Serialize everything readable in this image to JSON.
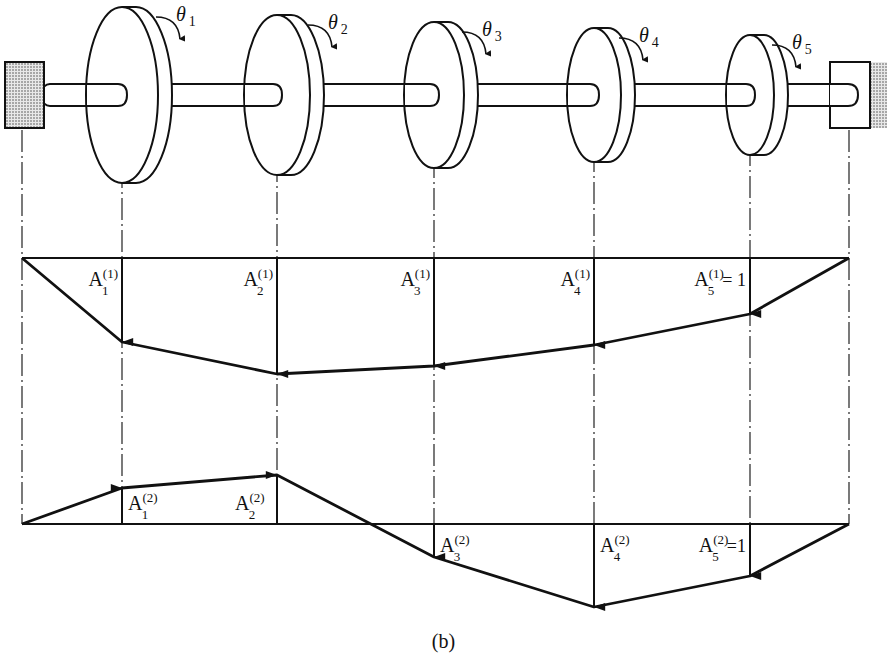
{
  "figure": {
    "caption": "(b)"
  },
  "shaft": {
    "left_support": "fixed-wall-hatched",
    "right_support": "fixed-wall-hatched",
    "disks": [
      {
        "label": "θ",
        "sub": "1",
        "cx": 122,
        "rx": 36,
        "ry": 88
      },
      {
        "label": "θ",
        "sub": "2",
        "cx": 277,
        "rx": 33,
        "ry": 80
      },
      {
        "label": "θ",
        "sub": "3",
        "cx": 434,
        "rx": 30,
        "ry": 73
      },
      {
        "label": "θ",
        "sub": "4",
        "cx": 594,
        "rx": 27,
        "ry": 67
      },
      {
        "label": "θ",
        "sub": "5",
        "cx": 750,
        "rx": 24,
        "ry": 60
      }
    ]
  },
  "mode1": {
    "baseline_y": 258,
    "points_x": [
      22,
      122,
      277,
      434,
      594,
      750,
      849
    ],
    "points_y": [
      258,
      342,
      374,
      366,
      345,
      314,
      258
    ],
    "labels": [
      {
        "main": "A",
        "sup": "(1)",
        "sub": "1",
        "suffix": ""
      },
      {
        "main": "A",
        "sup": "(1)",
        "sub": "2",
        "suffix": ""
      },
      {
        "main": "A",
        "sup": "(1)",
        "sub": "3",
        "suffix": ""
      },
      {
        "main": "A",
        "sup": "(1)",
        "sub": "4",
        "suffix": ""
      },
      {
        "main": "A",
        "sup": "(1)",
        "sub": "5",
        "suffix": "= 1"
      }
    ]
  },
  "mode2": {
    "baseline_y": 524,
    "points_x": [
      22,
      122,
      277,
      434,
      594,
      750,
      849
    ],
    "points_y": [
      524,
      488,
      475,
      557,
      607,
      576,
      524
    ],
    "labels": [
      {
        "main": "A",
        "sup": "(2)",
        "sub": "1",
        "suffix": ""
      },
      {
        "main": "A",
        "sup": "(2)",
        "sub": "2",
        "suffix": ""
      },
      {
        "main": "A",
        "sup": "(2)",
        "sub": "3",
        "suffix": ""
      },
      {
        "main": "A",
        "sup": "(2)",
        "sub": "4",
        "suffix": ""
      },
      {
        "main": "A",
        "sup": "(2)",
        "sub": "5",
        "suffix": "=1"
      }
    ]
  }
}
